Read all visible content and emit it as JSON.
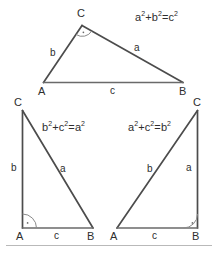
{
  "diagram": {
    "stroke_color": "#4c4c4c",
    "base_color": "#6a6a6a",
    "rule_color": "#b9b9b9",
    "text_color": "#2e2e2e",
    "background": "#ffffff"
  },
  "triangles": [
    {
      "id": "top",
      "name": "right-angle-at-c",
      "right_angle_vertex": "C",
      "formula": {
        "lhs1": "a",
        "lhs2": "b",
        "rhs": "c",
        "text": "a²+b²=c²"
      },
      "vertices": {
        "a": "A",
        "b": "B",
        "c": "C"
      },
      "sides": {
        "a": "a",
        "b": "b",
        "c": "c"
      }
    },
    {
      "id": "bottom-left",
      "name": "right-angle-at-a",
      "right_angle_vertex": "A",
      "formula": {
        "lhs1": "b",
        "lhs2": "c",
        "rhs": "a",
        "text": "b²+c²=a²"
      },
      "vertices": {
        "a": "A",
        "b": "B",
        "c": "C"
      },
      "sides": {
        "a": "a",
        "b": "b",
        "c": "c"
      }
    },
    {
      "id": "bottom-right",
      "name": "right-angle-at-b",
      "right_angle_vertex": "B",
      "formula": {
        "lhs1": "a",
        "lhs2": "c",
        "rhs": "b",
        "text": "a²+c²=b²"
      },
      "vertices": {
        "a": "A",
        "b": "B",
        "c": "C"
      },
      "sides": {
        "a": "a",
        "b": "b",
        "c": "c"
      }
    }
  ]
}
